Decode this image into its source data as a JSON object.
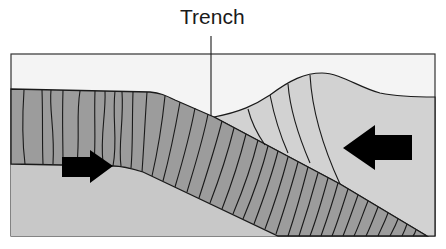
{
  "diagram": {
    "label": "Trench",
    "colors": {
      "background": "#ffffff",
      "sky": "#f4f4f4",
      "mantle": "#c8c8c8",
      "subducting_plate": "#9c9c9c",
      "overriding_plate": "#d2d2d2",
      "lines": "#1a1a1a",
      "arrows": "#000000"
    },
    "arrows": [
      {
        "direction": "right",
        "meaning": "subducting plate motion"
      },
      {
        "direction": "left",
        "meaning": "overriding plate motion"
      }
    ]
  }
}
